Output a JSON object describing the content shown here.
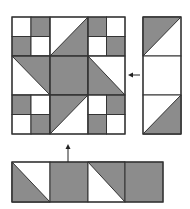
{
  "colors": {
    "gray": "#8c8c8c",
    "white": "#ffffff",
    "line": "#333333",
    "background": "#ffffff"
  },
  "main_block": {
    "description": "3x3 quilt block",
    "x": 12,
    "y": 17,
    "size": 113,
    "cells": [
      [
        "four-patch W-G/G-W",
        "half-square diag BL-TR gray lower-right",
        "four-patch G-W/W-G"
      ],
      [
        "half-square diag TL-BR gray upper-right",
        "solid gray",
        "half-square diag TL-BR gray lower-left"
      ],
      [
        "four-patch G-W/W-G",
        "half-square diag BL-TR gray upper-left",
        "four-patch W-G/G-W"
      ]
    ]
  },
  "right_strip": {
    "x": 143,
    "y": 17,
    "width": 38,
    "height": 117,
    "cells": [
      "half-square diag BL-TR gray upper-left",
      "solid white",
      "half-square diag BL-TR gray lower-right"
    ]
  },
  "bottom_strip": {
    "x": 12,
    "y": 162,
    "width": 151,
    "height": 40,
    "cells": [
      "half-square diag TL-BR gray lower-left",
      "solid gray",
      "half-square diag TL-BR gray upper-right",
      "solid gray"
    ]
  },
  "arrows": [
    {
      "name": "left-arrow",
      "from": [
        140,
        75
      ],
      "to": [
        128,
        75
      ]
    },
    {
      "name": "up-arrow",
      "from": [
        68,
        162
      ],
      "to": [
        68,
        144
      ]
    }
  ]
}
